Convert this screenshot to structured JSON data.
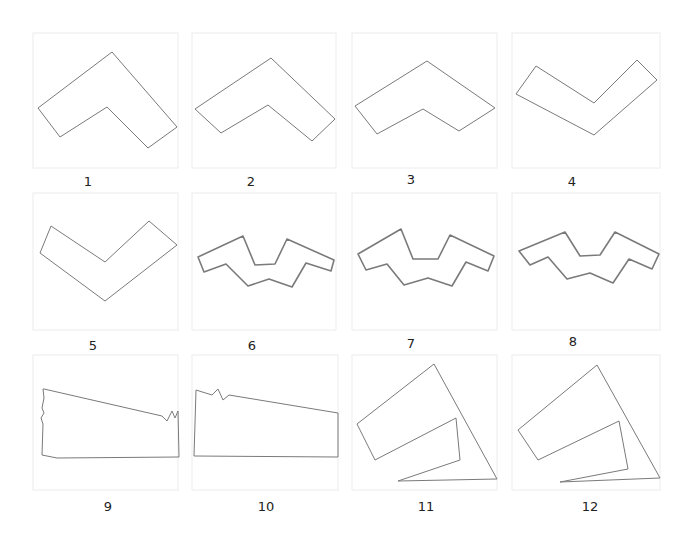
{
  "figure": {
    "frame_color": "#ececec",
    "stroke_color": "#7a7a7a",
    "cells": [
      {
        "label": "1",
        "shape": "chevron",
        "points": [
          [
            38,
            108
          ],
          [
            112,
            52
          ],
          [
            177,
            127
          ],
          [
            148,
            148
          ],
          [
            107,
            107
          ],
          [
            60,
            137
          ]
        ]
      },
      {
        "label": "2",
        "shape": "chevron",
        "points": [
          [
            195,
            109
          ],
          [
            271,
            58
          ],
          [
            335,
            119
          ],
          [
            312,
            141
          ],
          [
            268,
            105
          ],
          [
            221,
            133
          ]
        ]
      },
      {
        "label": "3",
        "shape": "chevron",
        "points": [
          [
            355,
            106
          ],
          [
            427,
            61
          ],
          [
            495,
            108
          ],
          [
            459,
            131
          ],
          [
            423,
            109
          ],
          [
            377,
            134
          ]
        ]
      },
      {
        "label": "4",
        "shape": "v-shape",
        "points": [
          [
            516,
            94
          ],
          [
            536,
            66
          ],
          [
            594,
            103
          ],
          [
            637,
            60
          ],
          [
            657,
            80
          ],
          [
            594,
            135
          ]
        ]
      },
      {
        "label": "5",
        "shape": "v-shape",
        "points": [
          [
            40,
            253
          ],
          [
            51,
            226
          ],
          [
            105,
            262
          ],
          [
            149,
            221
          ],
          [
            177,
            245
          ],
          [
            105,
            301
          ]
        ]
      },
      {
        "label": "6",
        "shape": "zigzag",
        "points": [
          [
            198,
            257
          ],
          [
            243,
            236
          ],
          [
            255,
            265
          ],
          [
            275,
            264
          ],
          [
            287,
            239
          ],
          [
            334,
            260
          ],
          [
            331,
            271
          ],
          [
            306,
            263
          ],
          [
            292,
            287
          ],
          [
            269,
            279
          ],
          [
            248,
            286
          ],
          [
            226,
            264
          ],
          [
            204,
            272
          ]
        ]
      },
      {
        "label": "7",
        "shape": "zigzag",
        "points": [
          [
            358,
            254
          ],
          [
            401,
            229
          ],
          [
            413,
            259
          ],
          [
            438,
            259
          ],
          [
            450,
            235
          ],
          [
            494,
            256
          ],
          [
            488,
            271
          ],
          [
            466,
            262
          ],
          [
            452,
            286
          ],
          [
            428,
            278
          ],
          [
            404,
            285
          ],
          [
            387,
            264
          ],
          [
            366,
            270
          ]
        ]
      },
      {
        "label": "8",
        "shape": "zigzag",
        "points": [
          [
            519,
            251
          ],
          [
            565,
            232
          ],
          [
            580,
            256
          ],
          [
            600,
            255
          ],
          [
            615,
            232
          ],
          [
            659,
            254
          ],
          [
            652,
            269
          ],
          [
            629,
            259
          ],
          [
            613,
            283
          ],
          [
            590,
            273
          ],
          [
            567,
            279
          ],
          [
            548,
            257
          ],
          [
            530,
            265
          ]
        ]
      },
      {
        "label": "9",
        "shape": "quadrilateral-jagged",
        "points": [
          [
            43,
            389
          ],
          [
            44,
            398
          ],
          [
            42,
            408
          ],
          [
            44,
            413
          ],
          [
            41,
            418
          ],
          [
            43,
            424
          ],
          [
            42,
            455
          ],
          [
            57,
            458
          ],
          [
            179,
            457
          ],
          [
            178,
            411
          ],
          [
            175,
            418
          ],
          [
            172,
            411
          ],
          [
            167,
            421
          ],
          [
            162,
            416
          ],
          [
            44,
            389
          ]
        ]
      },
      {
        "label": "10",
        "shape": "quadrilateral-jagged",
        "points": [
          [
            196,
            390
          ],
          [
            212,
            395
          ],
          [
            218,
            389
          ],
          [
            223,
            400
          ],
          [
            229,
            395
          ],
          [
            338,
            413
          ],
          [
            338,
            457
          ],
          [
            194,
            456
          ],
          [
            196,
            390
          ]
        ]
      },
      {
        "label": "11",
        "shape": "nested-quadrilateral",
        "points": [
          [
            434,
            364
          ],
          [
            497,
            479
          ],
          [
            398,
            481
          ],
          [
            460,
            460
          ],
          [
            456,
            418
          ],
          [
            375,
            460
          ],
          [
            357,
            424
          ]
        ]
      },
      {
        "label": "12",
        "shape": "nested-quadrilateral",
        "points": [
          [
            597,
            365
          ],
          [
            660,
            478
          ],
          [
            560,
            482
          ],
          [
            628,
            469
          ],
          [
            619,
            421
          ],
          [
            538,
            460
          ],
          [
            518,
            430
          ]
        ]
      }
    ]
  }
}
